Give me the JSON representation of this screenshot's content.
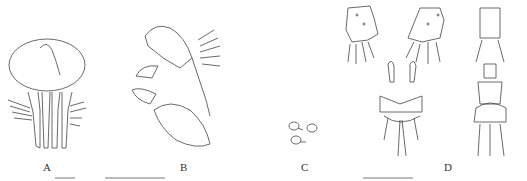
{
  "figure": {
    "panels": [
      {
        "id": "A",
        "label": "A",
        "description": "dorsal view of genitalia"
      },
      {
        "id": "B",
        "label": "B",
        "description": "lateral view of genitalia"
      },
      {
        "id": "C",
        "label": "C",
        "description": "three small egg-like structures"
      },
      {
        "id": "D",
        "label": "D",
        "description": "segments and appendages with setae"
      }
    ]
  }
}
